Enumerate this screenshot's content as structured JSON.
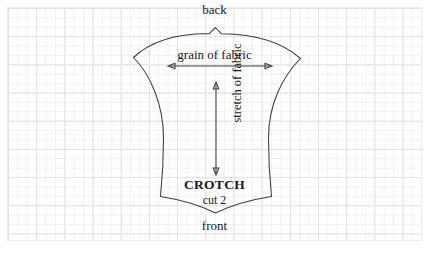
{
  "document": {
    "type": "sewing-pattern-diagram",
    "title": "CROTCH pattern piece on graph paper"
  },
  "canvas": {
    "width": 429,
    "height": 254,
    "background_color": "#ffffff"
  },
  "grid": {
    "name": "graph-paper",
    "minor_spacing_px": 9.4,
    "major_spacing_px": 28.2,
    "minor_color": "#f0f0f0",
    "major_color": "#e2e2e2",
    "border_color": "#ededed"
  },
  "pattern_piece": {
    "name": "crotch",
    "outline_color": "#3a3a3a",
    "fill": "none",
    "notches": [
      "top-center-v-notch",
      "bottom-center-v-notch"
    ],
    "labels": {
      "name_label": "CROTCH",
      "cut_label": "cut 2"
    }
  },
  "annotations": {
    "top_edge_label": "back",
    "bottom_edge_label": "front",
    "grain_label": "grain of fabric",
    "stretch_label": "stretch of fabric"
  },
  "markings": {
    "grain_arrow": {
      "orientation": "horizontal",
      "double_headed": true,
      "x_start": 168,
      "x_end": 272,
      "y": 66
    },
    "stretch_arrow": {
      "orientation": "vertical",
      "double_headed": true,
      "x": 216,
      "y_start": 82,
      "y_end": 175
    }
  }
}
